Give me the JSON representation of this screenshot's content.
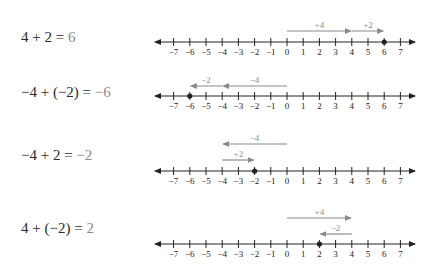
{
  "colors": {
    "axis": "#222222",
    "arrow": "#8a8a8a",
    "label": "#8a8a8a",
    "point": "#222222",
    "equation": "#2a2a2a",
    "result": "#8a8a8a"
  },
  "axis": {
    "min": -7,
    "max": 7,
    "tick_labels": [
      "−7",
      "−6",
      "−5",
      "−4",
      "−3",
      "−2",
      "−1",
      "0",
      "1",
      "2",
      "3",
      "4",
      "5",
      "6",
      "7"
    ]
  },
  "rows": [
    {
      "equation": {
        "lhs": "4 + 2 =",
        "result": "6"
      },
      "eq_top": 28,
      "line_y": 42,
      "point": 6,
      "arrows": [
        {
          "from": 0,
          "to": 4,
          "label": "+4",
          "y": 31
        },
        {
          "from": 4,
          "to": 6,
          "label": "+2",
          "y": 31
        }
      ]
    },
    {
      "equation": {
        "lhs": "−4 + (−2) =",
        "result": "−6"
      },
      "eq_top": 83,
      "line_y": 96,
      "point": -6,
      "arrows": [
        {
          "from": 0,
          "to": -4,
          "label": "−4",
          "y": 86
        },
        {
          "from": -4,
          "to": -6,
          "label": "−2",
          "y": 86
        }
      ]
    },
    {
      "equation": {
        "lhs": "−4 + 2 =",
        "result": "−2"
      },
      "eq_top": 146,
      "line_y": 171,
      "point": -2,
      "arrows": [
        {
          "from": 0,
          "to": -4,
          "label": "−4",
          "y": 144
        },
        {
          "from": -4,
          "to": -2,
          "label": "+2",
          "y": 160
        }
      ]
    },
    {
      "equation": {
        "lhs": "4 + (−2) =",
        "result": "2"
      },
      "eq_top": 219,
      "line_y": 244,
      "point": 2,
      "arrows": [
        {
          "from": 0,
          "to": 4,
          "label": "+4",
          "y": 218
        },
        {
          "from": 4,
          "to": 2,
          "label": "−2",
          "y": 234
        }
      ]
    }
  ]
}
